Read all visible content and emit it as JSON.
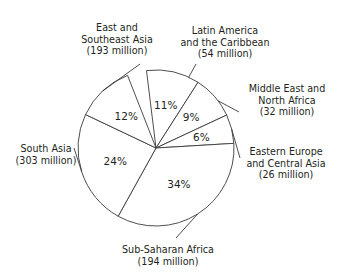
{
  "chart_data": {
    "type": "pie",
    "title": "",
    "subtitle": "",
    "xlabel": "",
    "ylabel": "",
    "legend_position": "none",
    "grid": false,
    "unit": "million",
    "total_millions": 802,
    "categories": [
      "Latin America and the Caribbean",
      "Middle East and North Africa",
      "Eastern Europe and Central Asia",
      "Sub-Saharan Africa",
      "South Asia",
      "East and Southeast Asia"
    ],
    "values": [
      11,
      9,
      6,
      34,
      24,
      12
    ],
    "slices": [
      {
        "key": "latin-america",
        "label_line1": "Latin America",
        "label_line2": "and the Caribbean",
        "label_line3": "(54 million)",
        "percent": 11,
        "percent_text": "11%",
        "value_millions": 54,
        "value_text": "(54 million)"
      },
      {
        "key": "middle-east",
        "label_line1": "Middle East and",
        "label_line2": "North Africa",
        "label_line3": "(32 million)",
        "percent": 9,
        "percent_text": "9%",
        "value_millions": 32,
        "value_text": "(32 million)"
      },
      {
        "key": "eastern-europe",
        "label_line1": "Eastern Europe",
        "label_line2": "and Central Asia",
        "label_line3": "(26 million)",
        "percent": 6,
        "percent_text": "6%",
        "value_millions": 26,
        "value_text": "(26 million)"
      },
      {
        "key": "sub-saharan-africa",
        "label_line1": "Sub-Saharan Africa",
        "label_line2": "(194 million)",
        "label_line3": "",
        "percent": 34,
        "percent_text": "34%",
        "value_millions": 194,
        "value_text": "(194 million)"
      },
      {
        "key": "south-asia",
        "label_line1": "South Asia",
        "label_line2": "(303 million)",
        "label_line3": "",
        "percent": 24,
        "percent_text": "24%",
        "value_millions": 303,
        "value_text": "(303 million)"
      },
      {
        "key": "east-southeast-asia",
        "label_line1": "East and",
        "label_line2": "Southeast Asia",
        "label_line3": "(193 million)",
        "percent": 12,
        "percent_text": "12%",
        "value_millions": 193,
        "value_text": "(193 million)"
      }
    ],
    "colors": {
      "slice_fill": "#ffffff",
      "slice_stroke": "#3a3a3a",
      "text": "#231f20",
      "background": "#ffffff"
    },
    "geometry": {
      "center_x": 156,
      "center_y": 148,
      "radius": 78,
      "start_angle_deg": -7
    }
  }
}
